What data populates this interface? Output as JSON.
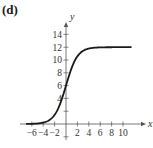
{
  "panel_label": "(d)",
  "chart_data": {
    "type": "line",
    "title": "",
    "xlabel": "x",
    "ylabel": "y",
    "xlim": [
      -7.5,
      12
    ],
    "ylim": [
      -2,
      16
    ],
    "grid": false,
    "x_ticks": [
      -6,
      -4,
      -2,
      2,
      4,
      6,
      8,
      10
    ],
    "x_tick_labels": [
      "−6",
      "−4",
      "−2",
      "2",
      "4",
      "6",
      "8",
      "10"
    ],
    "y_ticks": [
      2,
      4,
      6,
      8,
      10,
      12,
      14
    ],
    "y_tick_labels": [
      "4",
      "6",
      "8",
      "10",
      "12",
      "14"
    ],
    "y_tick_labeled": [
      4,
      6,
      8,
      10,
      12,
      14
    ],
    "series": [
      {
        "name": "logistic curve",
        "color": "#1a1a1a",
        "x": [
          -7,
          -6,
          -5,
          -4,
          -3,
          -2,
          -1,
          0,
          1,
          2,
          3,
          4,
          5,
          6,
          7,
          8,
          9,
          10,
          11.5
        ],
        "y": [
          0.01,
          0.03,
          0.08,
          0.21,
          0.57,
          1.43,
          3.23,
          6.0,
          8.77,
          10.57,
          11.43,
          11.79,
          11.92,
          11.97,
          11.99,
          12.0,
          12.0,
          12.0,
          12.0
        ]
      }
    ],
    "asymptote": 12
  },
  "colors": {
    "curve": "#1a1a1a",
    "axis": "#555555",
    "text": "#333333"
  }
}
